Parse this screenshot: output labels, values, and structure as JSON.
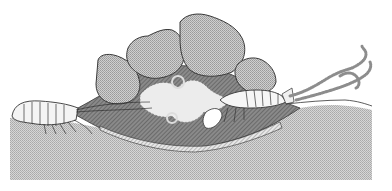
{
  "figure": {
    "colors": {
      "background": "#ffffff",
      "sediment": "#c9c9c9",
      "rock": "#bdbdbd",
      "rock_outline": "#3a3a3a",
      "burrow_dark": "#7a7a7a",
      "burrow_mid": "#9e9e9e",
      "animal_fill": "#f4f4f4",
      "plume": "#8d8d8d"
    },
    "elements": [
      {
        "id": "sediment",
        "label": "sediment"
      },
      {
        "id": "rocks",
        "label": "rock pile",
        "count": 5
      },
      {
        "id": "burrow",
        "label": "burrow chamber"
      },
      {
        "id": "animal-left",
        "label": "crustacean left"
      },
      {
        "id": "animal-right",
        "label": "crustacean right"
      },
      {
        "id": "plume",
        "label": "particle plume"
      }
    ]
  }
}
